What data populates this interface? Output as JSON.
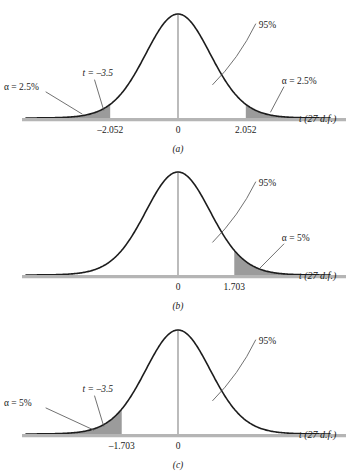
{
  "figure": {
    "name": "t-distribution critical regions",
    "df_label": "t (27 d.f.)",
    "colors": {
      "curve": "#1d1d1d",
      "shade": "#9b9b9b",
      "axis": "#b5b5b5",
      "center_line": "#b0b0b0",
      "leader": "#4c4c4c",
      "background": "#ffffff"
    }
  },
  "chart_data": {
    "type": "line",
    "title": "",
    "xlabel": "t (27 d.f.)",
    "ylabel": "",
    "distribution": "Student t",
    "degrees_of_freedom": 27,
    "xlim": [
      -4.6,
      4.6
    ],
    "grid": false,
    "legend": "none",
    "panels": [
      {
        "id": "a",
        "caption": "(a)",
        "test_type": "two-tailed",
        "confidence_label": "95%",
        "critical_values": [
          -2.052,
          2.052
        ],
        "tick_labels": [
          "-2.052",
          "0",
          "2.052"
        ],
        "tick_values": [
          -2.052,
          0,
          2.052
        ],
        "shaded_regions": [
          {
            "side": "left",
            "bound": -2.052,
            "alpha_label": "α = 2.5%",
            "alpha": 0.025
          },
          {
            "side": "right",
            "bound": 2.052,
            "alpha_label": "α = 2.5%",
            "alpha": 0.025
          }
        ],
        "test_statistic": {
          "label": "t = –3.5",
          "value": -3.5,
          "shown": true
        },
        "axis_label": "t (27 d.f.)"
      },
      {
        "id": "b",
        "caption": "(b)",
        "test_type": "one-tailed-right",
        "confidence_label": "95%",
        "critical_values": [
          1.703
        ],
        "tick_labels": [
          "0",
          "1.703"
        ],
        "tick_values": [
          0,
          1.703
        ],
        "shaded_regions": [
          {
            "side": "right",
            "bound": 1.703,
            "alpha_label": "α = 5%",
            "alpha": 0.05
          }
        ],
        "test_statistic": {
          "label": "",
          "value": null,
          "shown": false
        },
        "axis_label": "t (27 d.f.)"
      },
      {
        "id": "c",
        "caption": "(c)",
        "test_type": "one-tailed-left",
        "confidence_label": "95%",
        "critical_values": [
          -1.703
        ],
        "tick_labels": [
          "-1.703",
          "0"
        ],
        "tick_values": [
          -1.703,
          0
        ],
        "shaded_regions": [
          {
            "side": "left",
            "bound": -1.703,
            "alpha_label": "α = 5%",
            "alpha": 0.05
          }
        ],
        "test_statistic": {
          "label": "t = –3.5",
          "value": -3.5,
          "shown": true
        },
        "axis_label": "t (27 d.f.)"
      }
    ]
  },
  "panel_a": {
    "caption": "(a)",
    "confidence": "95%",
    "alpha_left": "α = 2.5%",
    "alpha_right": "α = 2.5%",
    "t_stat": "t = –3.5",
    "tick_neg": "–2.052",
    "tick_zero": "0",
    "tick_pos": "2.052",
    "axis_label": "t (27 d.f.)"
  },
  "panel_b": {
    "caption": "(b)",
    "confidence": "95%",
    "alpha_right": "α = 5%",
    "tick_zero": "0",
    "tick_pos": "1.703",
    "axis_label": "t (27 d.f.)"
  },
  "panel_c": {
    "caption": "(c)",
    "confidence": "95%",
    "alpha_left": "α = 5%",
    "t_stat": "t = –3.5",
    "tick_neg": "–1.703",
    "tick_zero": "0",
    "axis_label": "t (27 d.f.)"
  }
}
